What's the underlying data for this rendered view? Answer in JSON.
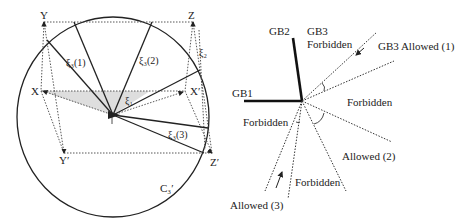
{
  "left_diagram": {
    "vertices": {
      "Y": "Y",
      "Z": "Z",
      "X": "X",
      "X_prime": "X′",
      "Y_prime": "Y′",
      "Z_prime": "Z′"
    },
    "labels": {
      "xi3_1": "ξ₃(1)",
      "xi3_2": "ξ₃(2)",
      "xi3_3": "ξ₃(3)",
      "xi2": "ξ₂",
      "xi1": "ξ₁",
      "circle": "C₃′",
      "center": "T"
    }
  },
  "right_diagram": {
    "boundaries": {
      "gb1": "GB1",
      "gb2": "GB2",
      "gb3": "GB3"
    },
    "regions": {
      "gb3_forbidden": "Forbidden",
      "gb3_allowed_1": "GB3 Allowed (1)",
      "forbidden_right": "Forbidden",
      "forbidden_left": "Forbidden",
      "allowed_2": "Allowed (2)",
      "forbidden_bottom": "Forbidden",
      "allowed_3": "Allowed (3)"
    }
  },
  "colors": {
    "ink": "#222222",
    "shade": "#d9d9d9",
    "background": "#ffffff"
  }
}
